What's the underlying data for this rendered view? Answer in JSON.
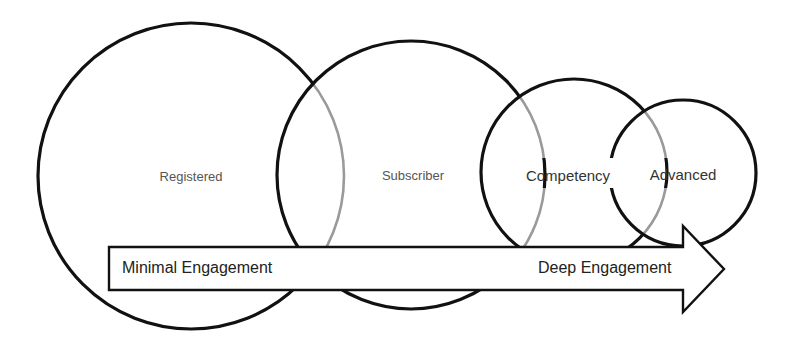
{
  "diagram": {
    "type": "overlapping-circles-with-arrow",
    "colors": {
      "stroke": "#111111",
      "overlap_stroke": "#9a9a9a",
      "background": "#ffffff",
      "text": "#333333"
    },
    "circles": [
      {
        "id": "registered",
        "label": "Registered",
        "cx": 191,
        "cy": 176,
        "r": 153
      },
      {
        "id": "subscriber",
        "label": "Subscriber",
        "cx": 411,
        "cy": 175,
        "r": 134
      },
      {
        "id": "competency",
        "label": "Competency",
        "cx": 574,
        "cy": 172,
        "r": 93
      },
      {
        "id": "advanced",
        "label": "Advanced",
        "cx": 683,
        "cy": 173,
        "r": 73
      }
    ],
    "arrow": {
      "start_label": "Minimal Engagement",
      "end_label": "Deep Engagement",
      "direction": "left-to-right"
    }
  }
}
